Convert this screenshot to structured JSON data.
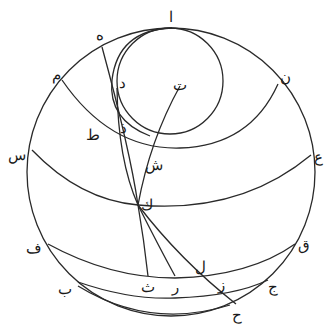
{
  "diagram": {
    "type": "geometric-astronomical-construction",
    "stroke_color": "#2a2a2a",
    "background": "#ffffff",
    "labels": [
      {
        "id": "alif",
        "text": "ا",
        "x": 170,
        "y": 22
      },
      {
        "id": "ha",
        "text": "ه",
        "x": 98,
        "y": 40
      },
      {
        "id": "mim",
        "text": "م",
        "x": 55,
        "y": 78
      },
      {
        "id": "nun",
        "text": "ن",
        "x": 282,
        "y": 80
      },
      {
        "id": "dal",
        "text": "د",
        "x": 126,
        "y": 88
      },
      {
        "id": "ta",
        "text": "ت",
        "x": 184,
        "y": 90
      },
      {
        "id": "tah",
        "text": "ط",
        "x": 92,
        "y": 140
      },
      {
        "id": "dhal",
        "text": "ذ",
        "x": 125,
        "y": 133
      },
      {
        "id": "shin",
        "text": "ش",
        "x": 151,
        "y": 167
      },
      {
        "id": "sin",
        "text": "س",
        "x": 14,
        "y": 160
      },
      {
        "id": "ayn",
        "text": "ع",
        "x": 318,
        "y": 161
      },
      {
        "id": "kaf",
        "text": "ك",
        "x": 147,
        "y": 210
      },
      {
        "id": "fa",
        "text": "ف",
        "x": 32,
        "y": 250
      },
      {
        "id": "qaf",
        "text": "ق",
        "x": 308,
        "y": 248
      },
      {
        "id": "lam",
        "text": "ل",
        "x": 196,
        "y": 271
      },
      {
        "id": "jim",
        "text": "ج",
        "x": 273,
        "y": 290
      },
      {
        "id": "zay",
        "text": "ز",
        "x": 224,
        "y": 288
      },
      {
        "id": "ra",
        "text": "ر",
        "x": 178,
        "y": 290
      },
      {
        "id": "tha",
        "text": "ث",
        "x": 147,
        "y": 291
      },
      {
        "id": "ba",
        "text": "ب",
        "x": 66,
        "y": 294
      },
      {
        "id": "hah",
        "text": "ح",
        "x": 240,
        "y": 318
      }
    ]
  }
}
